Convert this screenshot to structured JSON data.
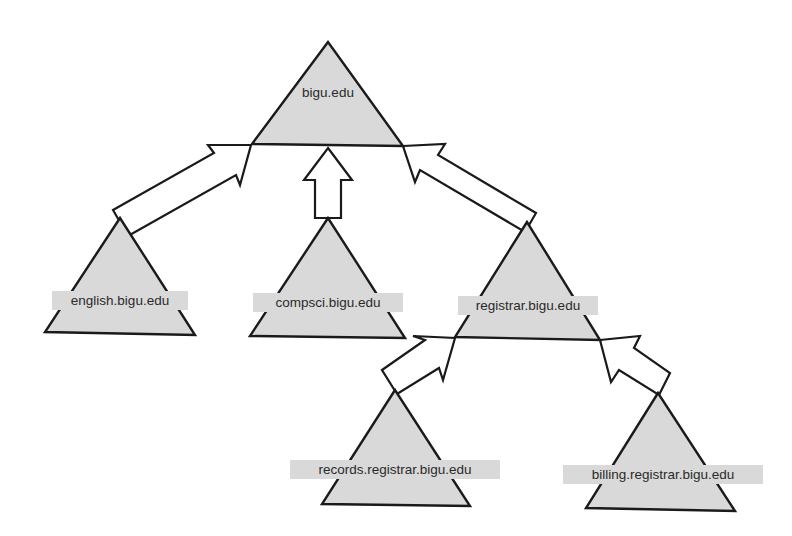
{
  "diagram": {
    "type": "domain-hierarchy",
    "colors": {
      "triangle_fill": "#d9d9d9",
      "stroke": "#1a1a1a",
      "arrow_fill": "#ffffff",
      "background": "#ffffff"
    },
    "nodes": [
      {
        "id": "root",
        "label": "bigu.edu"
      },
      {
        "id": "english",
        "label": "english.bigu.edu"
      },
      {
        "id": "compsci",
        "label": "compsci.bigu.edu"
      },
      {
        "id": "registrar",
        "label": "registrar.bigu.edu"
      },
      {
        "id": "records",
        "label": "records.registrar.bigu.edu"
      },
      {
        "id": "billing",
        "label": "billing.registrar.bigu.edu"
      }
    ],
    "edges": [
      {
        "from": "english",
        "to": "root"
      },
      {
        "from": "compsci",
        "to": "root"
      },
      {
        "from": "registrar",
        "to": "root"
      },
      {
        "from": "records",
        "to": "registrar"
      },
      {
        "from": "billing",
        "to": "registrar"
      }
    ]
  }
}
